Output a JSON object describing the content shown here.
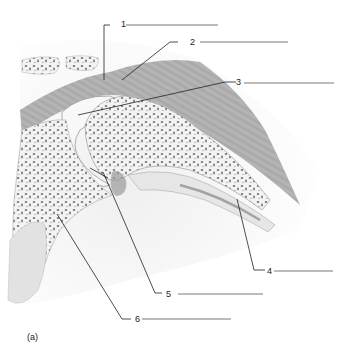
{
  "diagram": {
    "caption": "(a)",
    "labels": [
      {
        "number": "1",
        "answer": ""
      },
      {
        "number": "2",
        "answer": ""
      },
      {
        "number": "3",
        "answer": ""
      },
      {
        "number": "4",
        "answer": ""
      },
      {
        "number": "5",
        "answer": ""
      },
      {
        "number": "6",
        "answer": ""
      }
    ]
  }
}
